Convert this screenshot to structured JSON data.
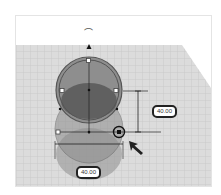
{
  "viewport": {
    "name": "3D workplane",
    "shape": "cylinder (selected)",
    "colors": {
      "grid_bg": "#d9d9d9",
      "grid_line": "#bfbfbf",
      "shape_fill": "#8a8a8a",
      "shape_dark": "#555555",
      "handle_stroke": "#333333"
    }
  },
  "dimensions": {
    "height_label": "40.00",
    "width_label": "40.00"
  },
  "icons": {
    "rotate": "rotate-arc-icon",
    "lift": "lift-cone-icon",
    "cursor": "mouse-pointer-icon"
  },
  "glyphs": {
    "rotate_arc": "⌒"
  }
}
